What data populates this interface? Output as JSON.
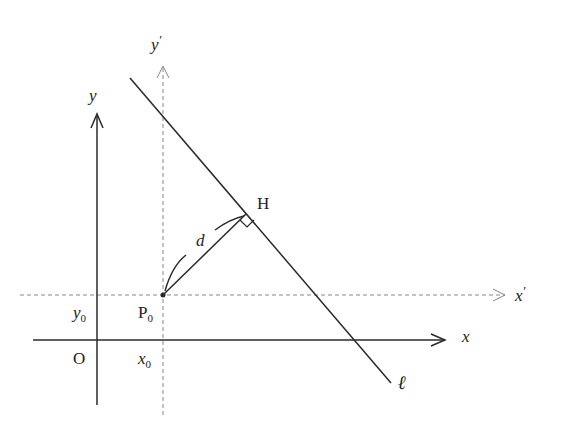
{
  "diagram": {
    "type": "coordinate-geometry",
    "labels": {
      "y_axis": "y",
      "x_axis": "x",
      "y_prime_axis": "y",
      "x_prime_axis": "x",
      "prime": "′",
      "origin": "O",
      "point_p": "P",
      "point_p_sub": "0",
      "foot": "H",
      "distance": "d",
      "line": "ℓ",
      "x0": "x",
      "x0_sub": "0",
      "y0": "y",
      "y0_sub": "0"
    },
    "colors": {
      "solid": "#2a2a2a",
      "dashed": "#888888"
    }
  }
}
